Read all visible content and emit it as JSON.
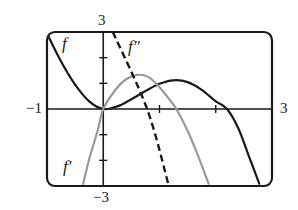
{
  "chart_data": {
    "type": "line",
    "title": "",
    "xlabel": "",
    "ylabel": "",
    "xlim": [
      -1,
      3
    ],
    "ylim": [
      -3,
      3
    ],
    "grid": false,
    "legend": "inline labels",
    "tick_labels": {
      "x_min": "−1",
      "x_max": "3",
      "y_max": "3",
      "y_min": "−3"
    },
    "series": [
      {
        "name": "f",
        "label": "f",
        "style": "solid",
        "color": "#1a1a1a",
        "points": [
          [
            -1.0,
            2.95
          ],
          [
            -0.75,
            1.85
          ],
          [
            -0.5,
            0.95
          ],
          [
            -0.25,
            0.3
          ],
          [
            0.0,
            0.0
          ],
          [
            0.25,
            0.1
          ],
          [
            0.5,
            0.38
          ],
          [
            0.75,
            0.7
          ],
          [
            1.0,
            0.98
          ],
          [
            1.25,
            1.12
          ],
          [
            1.5,
            1.05
          ],
          [
            1.75,
            0.75
          ],
          [
            2.0,
            0.3
          ],
          [
            2.2,
            0.0
          ],
          [
            2.4,
            -0.75
          ],
          [
            2.6,
            -1.9
          ],
          [
            2.78,
            -2.95
          ]
        ]
      },
      {
        "name": "f'",
        "label": "f′",
        "style": "solid",
        "color": "#9a9a9a",
        "points": [
          [
            -0.36,
            -2.95
          ],
          [
            -0.25,
            -1.95
          ],
          [
            -0.1,
            -0.85
          ],
          [
            0.0,
            0.0
          ],
          [
            0.2,
            0.7
          ],
          [
            0.4,
            1.15
          ],
          [
            0.6,
            1.33
          ],
          [
            0.8,
            1.25
          ],
          [
            1.0,
            0.85
          ],
          [
            1.2,
            0.3
          ],
          [
            1.3,
            0.0
          ],
          [
            1.5,
            -0.85
          ],
          [
            1.7,
            -1.9
          ],
          [
            1.88,
            -2.95
          ]
        ]
      },
      {
        "name": "f''",
        "label": "f″",
        "style": "dashed",
        "color": "#1a1a1a",
        "points": [
          [
            0.17,
            3.0
          ],
          [
            0.78,
            0.0
          ],
          [
            1.16,
            -2.95
          ]
        ]
      }
    ]
  },
  "labels": {
    "f": "f",
    "f_prime": "f′",
    "f_double_prime": "f″",
    "y_top": "3",
    "y_bottom": "−3",
    "x_left": "−1",
    "x_right": "3"
  }
}
